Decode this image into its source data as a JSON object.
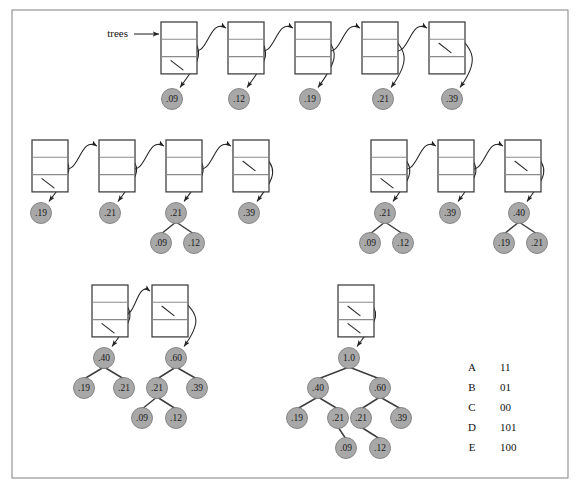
{
  "figure": {
    "frame": {
      "x": 12,
      "y": 10,
      "width": 556,
      "height": 468
    },
    "colors": {
      "circle_fill": "#a8a8a8",
      "circle_stroke": "#7e7e7e",
      "box_stroke": "#3a3a3a",
      "arrow_stroke": "#232323",
      "frame_stroke": "#8d8d8d",
      "text": "#111111",
      "background": "#ffffff"
    },
    "list_label": {
      "text": "trees",
      "x": 146,
      "y": 34
    }
  },
  "stages": [
    {
      "name": "stage-1-five-trees",
      "nodes": [
        {
          "id": "s1n1",
          "x": 161,
          "y": 22,
          "nil_cells": [
            3
          ]
        },
        {
          "id": "s1n2",
          "x": 228,
          "y": 22,
          "nil_cells": []
        },
        {
          "id": "s1n3",
          "x": 295,
          "y": 22,
          "nil_cells": []
        },
        {
          "id": "s1n4",
          "x": 362,
          "y": 22,
          "nil_cells": []
        },
        {
          "id": "s1n5",
          "x": 429,
          "y": 22,
          "nil_cells": [
            2
          ]
        }
      ],
      "trees": [
        {
          "root": {
            "label": ".09",
            "x": 172,
            "y": 99
          },
          "children": []
        },
        {
          "root": {
            "label": ".12",
            "x": 239,
            "y": 99
          },
          "children": []
        },
        {
          "root": {
            "label": ".19",
            "x": 310,
            "y": 99
          },
          "children": []
        },
        {
          "root": {
            "label": ".21",
            "x": 383,
            "y": 99
          },
          "children": []
        },
        {
          "root": {
            "label": ".39",
            "x": 452,
            "y": 99
          },
          "children": []
        }
      ]
    },
    {
      "name": "stage-2-left-four-trees",
      "nodes": [
        {
          "id": "s2n1",
          "x": 32,
          "y": 140,
          "nil_cells": [
            3
          ]
        },
        {
          "id": "s2n2",
          "x": 99,
          "y": 140,
          "nil_cells": []
        },
        {
          "id": "s2n3",
          "x": 166,
          "y": 140,
          "nil_cells": []
        },
        {
          "id": "s2n4",
          "x": 233,
          "y": 140,
          "nil_cells": [
            2
          ]
        }
      ],
      "trees": [
        {
          "root": {
            "label": ".19",
            "x": 41,
            "y": 213
          },
          "children": []
        },
        {
          "root": {
            "label": ".21",
            "x": 110,
            "y": 213
          },
          "children": []
        },
        {
          "root": {
            "label": ".21",
            "x": 176,
            "y": 213
          },
          "children": [
            {
              "label": ".09",
              "x": 161,
              "y": 243
            },
            {
              "label": ".12",
              "x": 194,
              "y": 243
            }
          ]
        },
        {
          "root": {
            "label": ".39",
            "x": 249,
            "y": 213
          },
          "children": []
        }
      ]
    },
    {
      "name": "stage-3-right-three-trees",
      "nodes": [
        {
          "id": "s3n1",
          "x": 371,
          "y": 140,
          "nil_cells": [
            3
          ]
        },
        {
          "id": "s3n2",
          "x": 438,
          "y": 140,
          "nil_cells": []
        },
        {
          "id": "s3n3",
          "x": 505,
          "y": 140,
          "nil_cells": [
            2
          ]
        }
      ],
      "trees": [
        {
          "root": {
            "label": ".21",
            "x": 385,
            "y": 213
          },
          "children": [
            {
              "label": ".09",
              "x": 370,
              "y": 243
            },
            {
              "label": ".12",
              "x": 403,
              "y": 243
            }
          ]
        },
        {
          "root": {
            "label": ".39",
            "x": 450,
            "y": 213
          },
          "children": []
        },
        {
          "root": {
            "label": ".40",
            "x": 519,
            "y": 213
          },
          "children": [
            {
              "label": ".19",
              "x": 504,
              "y": 243
            },
            {
              "label": ".21",
              "x": 537,
              "y": 243
            }
          ]
        }
      ]
    },
    {
      "name": "stage-4-two-trees",
      "nodes": [
        {
          "id": "s4n1",
          "x": 92,
          "y": 285,
          "nil_cells": [
            3
          ]
        },
        {
          "id": "s4n2",
          "x": 152,
          "y": 285,
          "nil_cells": [
            2
          ]
        }
      ],
      "trees": [
        {
          "root": {
            "label": ".40",
            "x": 104,
            "y": 358
          },
          "children": [
            {
              "label": ".19",
              "x": 84,
              "y": 388
            },
            {
              "label": ".21",
              "x": 124,
              "y": 388
            }
          ]
        },
        {
          "root": {
            "label": ".60",
            "x": 176,
            "y": 358
          },
          "children": [
            {
              "label": ".21",
              "x": 157,
              "y": 388
            },
            {
              "label": ".39",
              "x": 197,
              "y": 388
            },
            {
              "label": ".09",
              "x": 142,
              "y": 418
            },
            {
              "label": ".12",
              "x": 176,
              "y": 418
            }
          ]
        }
      ]
    },
    {
      "name": "stage-5-final-tree",
      "nodes": [
        {
          "id": "s5n1",
          "x": 338,
          "y": 285,
          "nil_cells": [
            2,
            3
          ]
        }
      ],
      "trees": [
        {
          "root": {
            "label": "1.0",
            "x": 349,
            "y": 358
          },
          "children": [
            {
              "label": ".40",
              "x": 318,
              "y": 388
            },
            {
              "label": ".60",
              "x": 380,
              "y": 388
            },
            {
              "label": ".19",
              "x": 297,
              "y": 418
            },
            {
              "label": ".21",
              "x": 338,
              "y": 418
            },
            {
              "label": ".21",
              "x": 361,
              "y": 418
            },
            {
              "label": ".39",
              "x": 401,
              "y": 418
            },
            {
              "label": ".09",
              "x": 346,
              "y": 448
            },
            {
              "label": ".12",
              "x": 380,
              "y": 448
            }
          ]
        }
      ]
    }
  ],
  "code_table": {
    "x_symbol": 472,
    "x_bits": 500,
    "y_start": 368,
    "row_gap": 20,
    "rows": [
      {
        "symbol": "A",
        "code": "11"
      },
      {
        "symbol": "B",
        "code": "01"
      },
      {
        "symbol": "C",
        "code": "00"
      },
      {
        "symbol": "D",
        "code": "101"
      },
      {
        "symbol": "E",
        "code": "100"
      }
    ]
  }
}
